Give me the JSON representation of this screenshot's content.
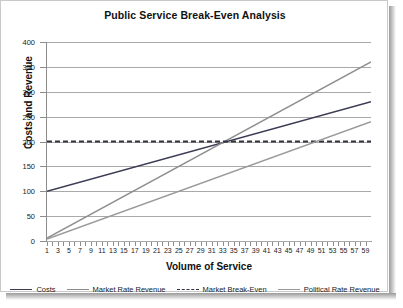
{
  "chart_data": {
    "type": "line",
    "title": "Public Service Break-Even Analysis",
    "xlabel": "Volume of Service",
    "ylabel": "Costs and Revenue",
    "xlim": [
      1,
      60
    ],
    "ylim": [
      0,
      400
    ],
    "yticks": [
      0,
      50,
      100,
      150,
      200,
      250,
      300,
      350,
      400
    ],
    "xticks": [
      1,
      3,
      5,
      7,
      9,
      11,
      13,
      15,
      17,
      19,
      21,
      23,
      25,
      27,
      29,
      31,
      33,
      35,
      37,
      39,
      41,
      43,
      45,
      47,
      49,
      51,
      53,
      55,
      57,
      59
    ],
    "grid": true,
    "legend_position": "bottom",
    "annotations": [
      "Costs and Market Rate Revenue intersect the break-even level of 200 at a volume of about 33"
    ],
    "series": [
      {
        "name": "Costs",
        "color": "#3b3b55",
        "style": "solid",
        "start": {
          "x": 1,
          "y": 100
        },
        "end": {
          "x": 60,
          "y": 280
        },
        "x": [
          1,
          60
        ],
        "values": [
          100,
          280
        ]
      },
      {
        "name": "Market Rate Revenue",
        "color": "#8e8e8e",
        "style": "solid",
        "start": {
          "x": 1,
          "y": 6
        },
        "end": {
          "x": 60,
          "y": 360
        },
        "x": [
          1,
          60
        ],
        "values": [
          6,
          360
        ]
      },
      {
        "name": "Market Break-Even",
        "color": "#33333f",
        "style": "dashed",
        "start": {
          "x": 1,
          "y": 200
        },
        "end": {
          "x": 60,
          "y": 200
        },
        "x": [
          1,
          60
        ],
        "values": [
          200,
          200
        ]
      },
      {
        "name": "Political Rate Revenue",
        "color": "#9a9a9a",
        "style": "solid",
        "start": {
          "x": 1,
          "y": 4
        },
        "end": {
          "x": 60,
          "y": 240
        },
        "x": [
          1,
          60
        ],
        "values": [
          4,
          240
        ]
      }
    ]
  }
}
